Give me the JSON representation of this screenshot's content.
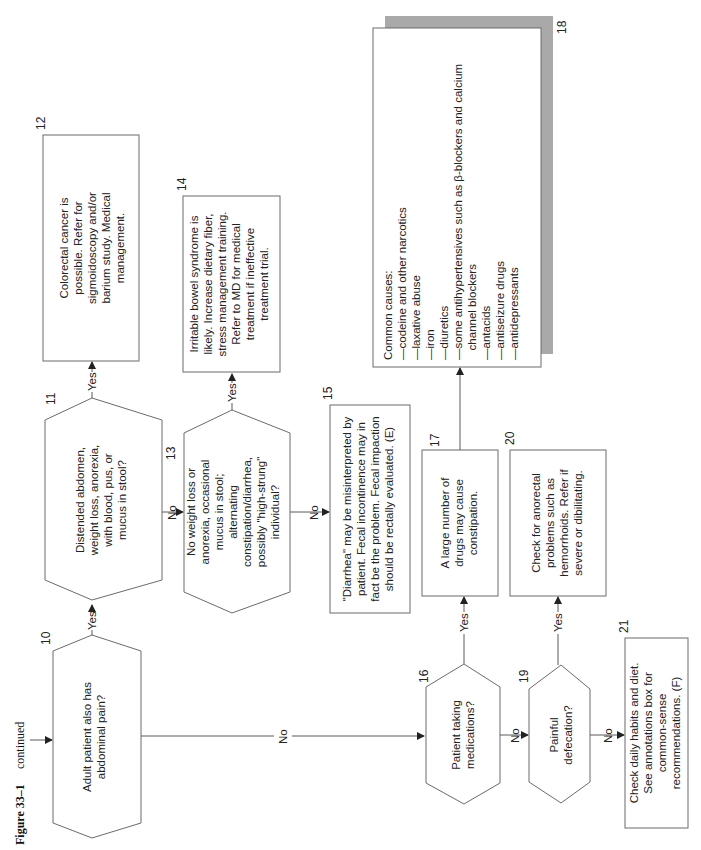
{
  "figure": {
    "label": "Figure 33–1",
    "suffix": "continued"
  },
  "edge_labels": {
    "yes": "Yes",
    "no": "No"
  },
  "nodes": {
    "n10": {
      "num": "10",
      "lines": [
        "Adult patient also has",
        "abdominal pain?"
      ]
    },
    "n11": {
      "num": "11",
      "lines": [
        "Distended abdomen,",
        "weight loss, anorexia,",
        "with blood, pus, or",
        "mucus in stool?"
      ]
    },
    "n12": {
      "num": "12",
      "lines": [
        "Colorectal cancer is",
        "possible. Refer for",
        "sigmoidoscopy and/or",
        "barium study. Medical",
        "management."
      ]
    },
    "n13": {
      "num": "13",
      "lines": [
        "No weight loss or",
        "anorexia, occasional",
        "mucus in stool;",
        "alternating",
        "constipation/diarrhea,",
        "possibly \"high-strung\"",
        "individual?"
      ]
    },
    "n14": {
      "num": "14",
      "lines": [
        "Irritable bowel syndrome is",
        "likely. Increase dietary fiber,",
        "stress management training.",
        "Refer to MD for medical",
        "treatment if ineffective",
        "treatment trial."
      ]
    },
    "n15": {
      "num": "15",
      "lines": [
        "\"Diarrhea\" may be misinterpreted by",
        "patient. Fecal incontinence may in",
        "fact be the problem.  Fecal impaction",
        "should be rectally evaluated. (E)"
      ]
    },
    "n16": {
      "num": "16",
      "lines": [
        "Patient taking",
        "medications?"
      ]
    },
    "n17": {
      "num": "17",
      "lines": [
        "A large number of",
        "drugs may cause",
        "constipation."
      ]
    },
    "n18": {
      "num": "18",
      "lines": [
        "Common causes:",
        "—codeine and other narcotics",
        "—laxative abuse",
        "—iron",
        "—diuretics",
        "—some antihypertensives such as β-blockers and calcium",
        "   channel blockers",
        "—antacids",
        "—antiseizure drugs",
        "—antidepressants"
      ]
    },
    "n19": {
      "num": "19",
      "lines": [
        "Painful",
        "defecation?"
      ]
    },
    "n20": {
      "num": "20",
      "lines": [
        "Check for anorectal",
        "problems such as",
        "hemorrhoids.  Refer if",
        "severe or dibilitating."
      ]
    },
    "n21": {
      "num": "21",
      "lines": [
        "Check daily habits and diet.",
        "See annotations box for",
        "common-sense",
        "recommendations. (F)"
      ]
    }
  },
  "colors": {
    "stroke": "#6b6b6b",
    "shadow": "#a9a9a9",
    "text": "#222222"
  }
}
